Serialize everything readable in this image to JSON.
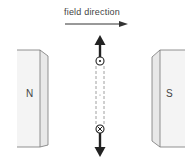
{
  "diagram": {
    "field_label": "field direction",
    "left_pole": "N",
    "right_pole": "S",
    "top_conductor_symbol": "dot (current out of page)",
    "bottom_conductor_symbol": "cross (current into page)",
    "force_top": "up",
    "force_bottom": "down",
    "colors": {
      "stroke": "#333333",
      "magnet_face": "#f4f4f4",
      "magnet_side": "#e6e6e6",
      "text": "#444444"
    }
  }
}
